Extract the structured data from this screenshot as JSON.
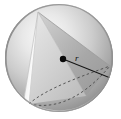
{
  "figure": {
    "name": "sphere-with-inscribed-cone",
    "background_color": "#ffffff",
    "canvas": {
      "width": 121,
      "height": 119
    }
  },
  "sphere": {
    "name": "sphere",
    "center": {
      "x": 59,
      "y": 58
    },
    "radius": 54,
    "outline_color": "#6b6b6b",
    "highlight_color": "#f2f2f2",
    "midtone_color": "#c9c9c9",
    "shadow_color": "#8a8a8a",
    "edge_color": "#777777"
  },
  "cone": {
    "name": "inscribed-cone",
    "apex": {
      "x": 38,
      "y": 12
    },
    "base_left": {
      "x": 29,
      "y": 104
    },
    "base_right": {
      "x": 110,
      "y": 66
    },
    "light_face_color": "#ededed",
    "dark_face_color": "#a9a9a9",
    "edge_color": "#8f8f8f"
  },
  "cone_base_ellipse": {
    "name": "cone-base-ellipse",
    "style": "dashed",
    "front_visible": true,
    "back_hidden": true,
    "dash_color": "#4a4a4a",
    "dash_pattern": "2.5 2.5"
  },
  "center_point": {
    "name": "sphere-center-point",
    "x": 63,
    "y": 59,
    "radius": 3.2,
    "color": "#0a0a0a"
  },
  "radius_segment": {
    "name": "radius-line",
    "from": {
      "x": 63,
      "y": 59
    },
    "to": {
      "x": 112,
      "y": 78
    },
    "color": "#141414",
    "width": 1.1
  },
  "labels": {
    "radius": {
      "name": "radius-label",
      "text": "r",
      "x": 75,
      "y": 61
    }
  }
}
